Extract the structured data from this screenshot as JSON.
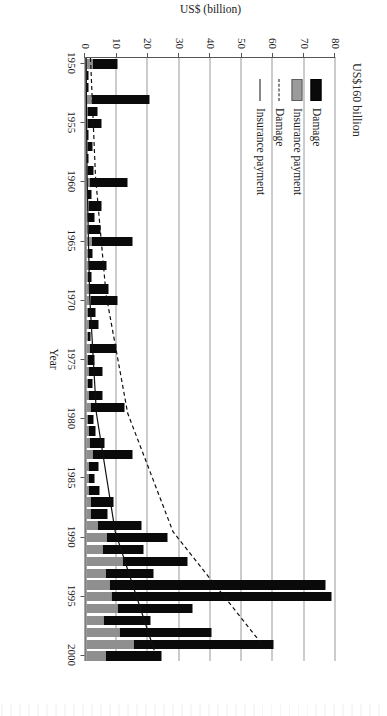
{
  "figure": {
    "annotation": "US$160 billion",
    "value_axis_label": "US$ (billion)",
    "year_axis_label": "Year"
  },
  "legend": {
    "items": [
      {
        "key": "dmg-bar",
        "label": "Damage"
      },
      {
        "key": "ins-bar",
        "label": "Insurance payment"
      },
      {
        "key": "dmg-line",
        "label": "Damage"
      },
      {
        "key": "ins-line",
        "label": "Insurance payment"
      }
    ]
  },
  "chart_data": {
    "type": "bar",
    "title": "",
    "subtitle": "",
    "xlabel": "Year",
    "ylabel": "US$ (billion)",
    "xlim": [
      1950,
      2001
    ],
    "ylim": [
      0,
      80
    ],
    "yticks": [
      0,
      10,
      20,
      30,
      40,
      50,
      60,
      70,
      80
    ],
    "xticks": [
      1950,
      1955,
      1960,
      1965,
      1970,
      1975,
      1980,
      1985,
      1990,
      1995,
      2000
    ],
    "grid": "horizontal",
    "legend_position": "upper-left",
    "stacked": true,
    "annotations": [
      {
        "text": "US$160 billion",
        "note": "bars for 1994 and 1995 exceed the 80 axis cap"
      }
    ],
    "colors": {
      "damage_bar": "#0a0a0a",
      "insurance_bar": "#8f8f8f",
      "damage_trend": "#111111",
      "insurance_trend": "#111111",
      "gridline": "#9a9a9a",
      "axis": "#555555",
      "background": "#ffffff"
    },
    "categories": [
      1950,
      1951,
      1952,
      1953,
      1954,
      1955,
      1956,
      1957,
      1958,
      1959,
      1960,
      1961,
      1962,
      1963,
      1964,
      1965,
      1966,
      1967,
      1968,
      1969,
      1970,
      1971,
      1972,
      1973,
      1974,
      1975,
      1976,
      1977,
      1978,
      1979,
      1980,
      1981,
      1982,
      1983,
      1984,
      1985,
      1986,
      1987,
      1988,
      1989,
      1990,
      1991,
      1992,
      1993,
      1994,
      1995,
      1996,
      1997,
      1998,
      1999,
      2000
    ],
    "series": [
      {
        "name": "Damage",
        "type": "bar-segment",
        "values": [
          8.0,
          0.6,
          0.4,
          18.7,
          3.2,
          4.6,
          0.5,
          1.6,
          0.5,
          2.0,
          12.0,
          1.3,
          4.3,
          2.2,
          4.1,
          13.0,
          1.7,
          5.6,
          1.5,
          6.2,
          8.7,
          2.5,
          3.2,
          1.1,
          8.5,
          2.2,
          4.3,
          1.7,
          4.4,
          10.9,
          2.0,
          2.4,
          4.9,
          12.9,
          3.2,
          2.1,
          3.5,
          7.1,
          5.4,
          14.0,
          19.5,
          13.2,
          20.8,
          15.5,
          69.0,
          70.5,
          24.0,
          15.0,
          29.5,
          45.0,
          18.0
        ]
      },
      {
        "name": "Insurance payment",
        "type": "bar-segment",
        "values": [
          1.8,
          0.1,
          0.1,
          1.5,
          0.2,
          0.3,
          0.1,
          0.2,
          0.1,
          0.2,
          1.0,
          0.2,
          0.6,
          0.3,
          0.5,
          1.6,
          0.2,
          0.8,
          0.2,
          0.9,
          1.2,
          0.4,
          0.5,
          0.2,
          1.0,
          0.3,
          0.7,
          0.3,
          0.6,
          1.4,
          0.4,
          0.5,
          0.9,
          1.9,
          0.6,
          0.5,
          0.7,
          1.4,
          1.2,
          3.5,
          6.5,
          5.0,
          11.5,
          6.0,
          7.5,
          8.0,
          10.0,
          5.5,
          10.5,
          15.0,
          6.0
        ]
      },
      {
        "name": "Damage trend",
        "type": "line",
        "style": "dashed",
        "x": [
          1950,
          1960,
          1970,
          1980,
          1990,
          2000
        ],
        "values": [
          1.6,
          3.2,
          6.6,
          13.5,
          28.0,
          58.0
        ]
      },
      {
        "name": "Insurance payment trend",
        "type": "line",
        "style": "solid",
        "x": [
          1950,
          1960,
          1970,
          1980,
          1990,
          2000
        ],
        "values": [
          0.2,
          0.5,
          1.3,
          3.5,
          9.5,
          22.0
        ]
      }
    ]
  }
}
